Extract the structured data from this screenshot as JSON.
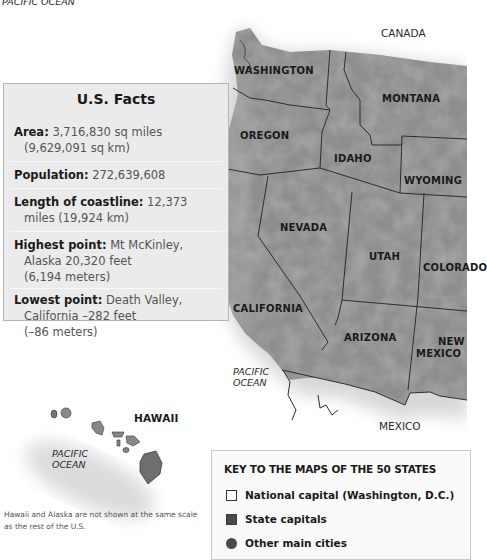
{
  "map": {
    "top_ocean_label": "PACIFIC OCEAN",
    "countries": {
      "north": "CANADA",
      "south": "MEXICO"
    },
    "ocean_labels": {
      "mainland": [
        "PACIFIC",
        "OCEAN"
      ],
      "hawaii": [
        "PACIFIC",
        "OCEAN"
      ]
    },
    "states": [
      {
        "name": "WASHINGTON",
        "x": 234,
        "y": 65
      },
      {
        "name": "MONTANA",
        "x": 382,
        "y": 93
      },
      {
        "name": "OREGON",
        "x": 240,
        "y": 130
      },
      {
        "name": "IDAHO",
        "x": 334,
        "y": 153
      },
      {
        "name": "WYOMING",
        "x": 404,
        "y": 175
      },
      {
        "name": "NEVADA",
        "x": 280,
        "y": 222
      },
      {
        "name": "UTAH",
        "x": 369,
        "y": 251
      },
      {
        "name": "COLORADO",
        "x": 423,
        "y": 262
      },
      {
        "name": "CALIFORNIA",
        "x": 233,
        "y": 303
      },
      {
        "name": "ARIZONA",
        "x": 344,
        "y": 332
      },
      {
        "name": "NEW",
        "x": 438,
        "y": 336
      },
      {
        "name": "MEXICO",
        "x": 416,
        "y": 349
      }
    ],
    "hawaii_label": "HAWAII"
  },
  "facts": {
    "title": "U.S. Facts",
    "items": [
      {
        "label": "Area:",
        "value": "3,716,830 sq miles",
        "cont": [
          "(9,629,091 sq km)"
        ]
      },
      {
        "label": "Population:",
        "value": "272,639,608",
        "cont": []
      },
      {
        "label": "Length of coastline:",
        "value": "12,373",
        "cont": [
          "miles (19,924 km)"
        ]
      },
      {
        "label": "Highest point:",
        "value": "Mt McKinley,",
        "cont": [
          "Alaska 20,320 feet",
          "(6,194 meters)"
        ]
      },
      {
        "label": "Lowest point:",
        "value": "Death Valley,",
        "cont": [
          "California –282 feet",
          "(–86 meters)"
        ]
      }
    ]
  },
  "key": {
    "title": "KEY TO THE MAPS OF THE 50 STATES",
    "items": [
      {
        "symbol": "square-outline",
        "label": "National capital (Washington, D.C.)"
      },
      {
        "symbol": "square-filled",
        "label": "State capitals"
      },
      {
        "symbol": "circle",
        "label": "Other main cities"
      }
    ]
  },
  "note": "Hawaii and Alaska are not shown at the same scale as the rest of the U.S.",
  "colors": {
    "land": "#8a8a8a",
    "border": "#2e2e2e",
    "facts_bg": "#ebebeb"
  }
}
